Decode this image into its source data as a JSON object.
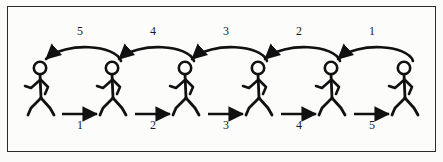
{
  "figure": {
    "border_color": "#2b2b2b",
    "background_color": "#fcfcfa",
    "ink_color": "#111111"
  },
  "walkers": [
    {
      "id": "walker-1",
      "x": 40,
      "y": 68,
      "facing": "right"
    },
    {
      "id": "walker-2",
      "x": 112,
      "y": 68,
      "facing": "right"
    },
    {
      "id": "walker-3",
      "x": 185,
      "y": 68,
      "facing": "right"
    },
    {
      "id": "walker-4",
      "x": 258,
      "y": 68,
      "facing": "right"
    },
    {
      "id": "walker-5",
      "x": 331,
      "y": 68,
      "facing": "right"
    },
    {
      "id": "walker-6",
      "x": 404,
      "y": 68,
      "facing": "right"
    }
  ],
  "forward_arrows": [
    {
      "id": "forward-arrow-1",
      "label": "1",
      "direction": "right",
      "x_start": 62,
      "x_end": 97,
      "y": 114,
      "label_x": 80,
      "label_y": 120
    },
    {
      "id": "forward-arrow-2",
      "label": "2",
      "direction": "right",
      "x_start": 135,
      "x_end": 170,
      "y": 114,
      "label_x": 153,
      "label_y": 120
    },
    {
      "id": "forward-arrow-3",
      "label": "3",
      "direction": "right",
      "x_start": 208,
      "x_end": 243,
      "y": 114,
      "label_x": 226,
      "label_y": 120
    },
    {
      "id": "forward-arrow-4",
      "label": "4",
      "direction": "right",
      "x_start": 281,
      "x_end": 316,
      "y": 114,
      "label_x": 299,
      "label_y": 120
    },
    {
      "id": "forward-arrow-5",
      "label": "5",
      "direction": "right",
      "x_start": 354,
      "x_end": 389,
      "y": 114,
      "label_x": 372,
      "label_y": 120
    }
  ],
  "return_arrows": [
    {
      "id": "return-arrow-5",
      "label": "5",
      "direction": "left",
      "x_start": 121,
      "x_end": 44,
      "y": 61,
      "apex_y": 45,
      "label_x": 80,
      "label_y": 31
    },
    {
      "id": "return-arrow-4",
      "label": "4",
      "direction": "left",
      "x_start": 194,
      "x_end": 117,
      "y": 61,
      "apex_y": 45,
      "label_x": 153,
      "label_y": 31
    },
    {
      "id": "return-arrow-3",
      "label": "3",
      "direction": "left",
      "x_start": 267,
      "x_end": 190,
      "y": 61,
      "apex_y": 45,
      "label_x": 226,
      "label_y": 31
    },
    {
      "id": "return-arrow-2",
      "label": "2",
      "direction": "left",
      "x_start": 340,
      "x_end": 263,
      "y": 61,
      "apex_y": 45,
      "label_x": 299,
      "label_y": 31
    },
    {
      "id": "return-arrow-1",
      "label": "1",
      "direction": "left",
      "x_start": 413,
      "x_end": 336,
      "y": 61,
      "apex_y": 45,
      "label_x": 372,
      "label_y": 31
    }
  ]
}
